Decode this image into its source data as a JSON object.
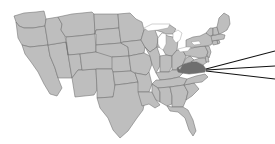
{
  "map": {
    "title": "United States state map",
    "projection": "albers-usa-like",
    "background_color": "#ffffff",
    "default_state_color": "#bebebe",
    "highlight_state_color": "#6f6f6f",
    "border_color": "#6e6e6e",
    "lake_color": "#ffffff",
    "highlighted_states": [
      "Virginia"
    ],
    "legend_visible": false,
    "labels_visible": false,
    "states": [
      {
        "code": "WA",
        "name": "Washington",
        "highlighted": false
      },
      {
        "code": "OR",
        "name": "Oregon",
        "highlighted": false
      },
      {
        "code": "CA",
        "name": "California",
        "highlighted": false
      },
      {
        "code": "NV",
        "name": "Nevada",
        "highlighted": false
      },
      {
        "code": "ID",
        "name": "Idaho",
        "highlighted": false
      },
      {
        "code": "MT",
        "name": "Montana",
        "highlighted": false
      },
      {
        "code": "WY",
        "name": "Wyoming",
        "highlighted": false
      },
      {
        "code": "UT",
        "name": "Utah",
        "highlighted": false
      },
      {
        "code": "AZ",
        "name": "Arizona",
        "highlighted": false
      },
      {
        "code": "CO",
        "name": "Colorado",
        "highlighted": false
      },
      {
        "code": "NM",
        "name": "New Mexico",
        "highlighted": false
      },
      {
        "code": "ND",
        "name": "North Dakota",
        "highlighted": false
      },
      {
        "code": "SD",
        "name": "South Dakota",
        "highlighted": false
      },
      {
        "code": "NE",
        "name": "Nebraska",
        "highlighted": false
      },
      {
        "code": "KS",
        "name": "Kansas",
        "highlighted": false
      },
      {
        "code": "OK",
        "name": "Oklahoma",
        "highlighted": false
      },
      {
        "code": "TX",
        "name": "Texas",
        "highlighted": false
      },
      {
        "code": "MN",
        "name": "Minnesota",
        "highlighted": false
      },
      {
        "code": "IA",
        "name": "Iowa",
        "highlighted": false
      },
      {
        "code": "MO",
        "name": "Missouri",
        "highlighted": false
      },
      {
        "code": "AR",
        "name": "Arkansas",
        "highlighted": false
      },
      {
        "code": "LA",
        "name": "Louisiana",
        "highlighted": false
      },
      {
        "code": "WI",
        "name": "Wisconsin",
        "highlighted": false
      },
      {
        "code": "IL",
        "name": "Illinois",
        "highlighted": false
      },
      {
        "code": "MI",
        "name": "Michigan",
        "highlighted": false
      },
      {
        "code": "IN",
        "name": "Indiana",
        "highlighted": false
      },
      {
        "code": "OH",
        "name": "Ohio",
        "highlighted": false
      },
      {
        "code": "KY",
        "name": "Kentucky",
        "highlighted": false
      },
      {
        "code": "TN",
        "name": "Tennessee",
        "highlighted": false
      },
      {
        "code": "MS",
        "name": "Mississippi",
        "highlighted": false
      },
      {
        "code": "AL",
        "name": "Alabama",
        "highlighted": false
      },
      {
        "code": "GA",
        "name": "Georgia",
        "highlighted": false
      },
      {
        "code": "FL",
        "name": "Florida",
        "highlighted": false
      },
      {
        "code": "SC",
        "name": "South Carolina",
        "highlighted": false
      },
      {
        "code": "NC",
        "name": "North Carolina",
        "highlighted": false
      },
      {
        "code": "VA",
        "name": "Virginia",
        "highlighted": true
      },
      {
        "code": "WV",
        "name": "West Virginia",
        "highlighted": false
      },
      {
        "code": "MD",
        "name": "Maryland",
        "highlighted": false
      },
      {
        "code": "DE",
        "name": "Delaware",
        "highlighted": false
      },
      {
        "code": "PA",
        "name": "Pennsylvania",
        "highlighted": false
      },
      {
        "code": "NJ",
        "name": "New Jersey",
        "highlighted": false
      },
      {
        "code": "NY",
        "name": "New York",
        "highlighted": false
      },
      {
        "code": "CT",
        "name": "Connecticut",
        "highlighted": false
      },
      {
        "code": "RI",
        "name": "Rhode Island",
        "highlighted": false
      },
      {
        "code": "MA",
        "name": "Massachusetts",
        "highlighted": false
      },
      {
        "code": "VT",
        "name": "Vermont",
        "highlighted": false
      },
      {
        "code": "NH",
        "name": "New Hampshire",
        "highlighted": false
      },
      {
        "code": "ME",
        "name": "Maine",
        "highlighted": false
      }
    ],
    "lakes": [
      "Lake Michigan",
      "Lake Superior",
      "Lake Huron",
      "Lake Erie",
      "Lake Ontario"
    ]
  },
  "callout": {
    "anchor_state": "Virginia",
    "line_color": "#111111",
    "line_count": 3,
    "lines": [
      {
        "id": "callout-line-upper",
        "from_x": 206,
        "from_y": 69,
        "to_x": 275,
        "to_y": 51
      },
      {
        "id": "callout-line-middle",
        "from_x": 206,
        "from_y": 70,
        "to_x": 275,
        "to_y": 66
      },
      {
        "id": "callout-line-lower",
        "from_x": 206,
        "from_y": 71,
        "to_x": 275,
        "to_y": 79
      }
    ]
  }
}
